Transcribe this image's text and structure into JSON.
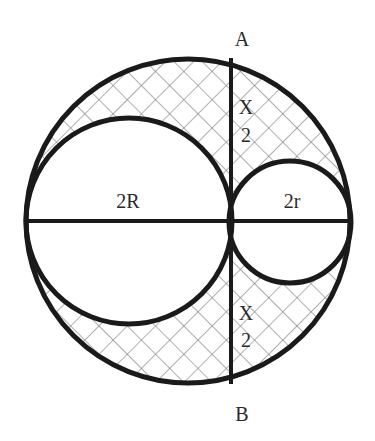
{
  "diagram": {
    "labels": {
      "top_point": "A",
      "bottom_point": "B",
      "large_diameter": "2R",
      "small_diameter": "2r",
      "upper_half_chord_num": "X",
      "upper_half_chord_den": "2",
      "lower_half_chord_num": "X",
      "lower_half_chord_den": "2"
    },
    "colors": {
      "stroke": "#1a1a1a",
      "hatch": "#7a7a7a",
      "background": "#ffffff"
    },
    "shapes": {
      "outer_circle": {
        "cx": 188,
        "cy": 221,
        "r": 162
      },
      "large_circle": {
        "cx": 129,
        "cy": 221,
        "r": 103
      },
      "small_circle": {
        "cx": 290,
        "cy": 222,
        "r": 61
      },
      "chord_AB": {
        "x": 231,
        "y1": 58,
        "y2": 384
      },
      "diameter_line": {
        "x1": 27,
        "x2": 350,
        "y": 221
      }
    }
  }
}
